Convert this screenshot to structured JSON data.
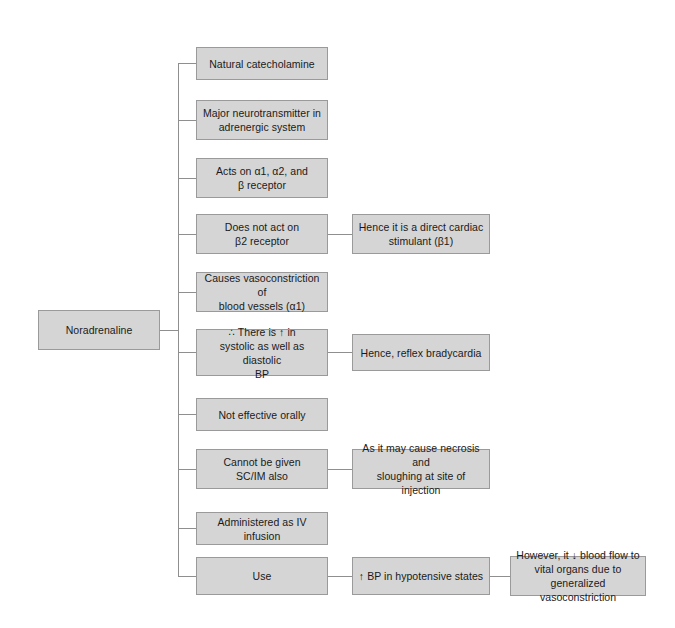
{
  "diagram": {
    "title": "Noradrenaline",
    "type": "flowchart",
    "orientation": "left-to-right tree",
    "colors": {
      "node_fill": "#d5d5d5",
      "node_border": "#9a9a9a",
      "connector": "#8f8f8f",
      "text": "#1a1a1a",
      "background": "#ffffff"
    },
    "root": {
      "label": "Noradrenaline"
    },
    "branches": [
      {
        "id": "branch-1",
        "label": "Natural catecholamine",
        "children": []
      },
      {
        "id": "branch-2",
        "label": "Major neurotransmitter in\nadrenergic system",
        "children": []
      },
      {
        "id": "branch-3",
        "label": "Acts on α1, α2, and\nβ receptor",
        "children": []
      },
      {
        "id": "branch-4",
        "label": "Does not act on\nβ2 receptor",
        "children": [
          {
            "id": "branch-4-child-1",
            "label": "Hence it is a direct cardiac\nstimulant (β1)",
            "children": []
          }
        ]
      },
      {
        "id": "branch-5",
        "label": "Causes vasoconstriction of\nblood vessels (α1)",
        "children": []
      },
      {
        "id": "branch-6",
        "label": "∴ There is ↑ in\nsystolic as well as diastolic\nBP",
        "children": [
          {
            "id": "branch-6-child-1",
            "label": "Hence, reflex bradycardia",
            "children": []
          }
        ]
      },
      {
        "id": "branch-7",
        "label": "Not effective orally",
        "children": []
      },
      {
        "id": "branch-8",
        "label": "Cannot be given\nSC/IM also",
        "children": [
          {
            "id": "branch-8-child-1",
            "label": "As it may cause necrosis and\nsloughing at site of injection",
            "children": []
          }
        ]
      },
      {
        "id": "branch-9",
        "label": "Administered as IV infusion",
        "children": []
      },
      {
        "id": "branch-10",
        "label": "Use",
        "children": [
          {
            "id": "branch-10-child-1",
            "label": "↑ BP in hypotensive states",
            "children": [
              {
                "id": "branch-10-grandchild-1",
                "label": "However, it ↓ blood flow to\nvital organs due to\ngeneralized vasoconstriction",
                "children": []
              }
            ]
          }
        ]
      }
    ]
  }
}
